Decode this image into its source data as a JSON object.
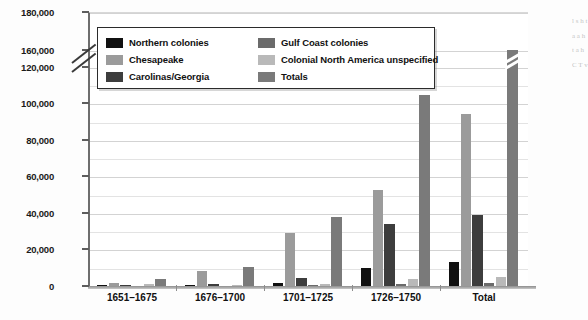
{
  "chart_data": {
    "type": "bar",
    "title": "",
    "xlabel": "",
    "ylabel": "",
    "grid": true,
    "legend_position": "top-left-inside",
    "categories": [
      "1651–1675",
      "1676–1700",
      "1701–1725",
      "1726–1750",
      "Total"
    ],
    "yticks": [
      "0",
      "20,000",
      "40,000",
      "60,000",
      "80,000",
      "100,000",
      "120,000",
      "160,000",
      "180,000"
    ],
    "ytick_values": [
      0,
      20000,
      40000,
      60000,
      80000,
      100000,
      120000,
      160000,
      180000
    ],
    "ylim": [
      0,
      180000
    ],
    "axis_break": {
      "below": 120000,
      "above": 160000,
      "label": "y-axis-break"
    },
    "minor_gridline_step": 10000,
    "series": [
      {
        "name": "Northern colonies",
        "color": "#111111",
        "values": [
          300,
          700,
          1600,
          9800,
          13000
        ]
      },
      {
        "name": "Chesapeake",
        "color": "#9b9b9b",
        "values": [
          1900,
          8000,
          29000,
          52800,
          94000
        ]
      },
      {
        "name": "Carolinas/Georgia",
        "color": "#3d3d3d",
        "values": [
          600,
          1000,
          4200,
          34000,
          39000
        ]
      },
      {
        "name": "Gulf Coast colonies",
        "color": "#6b6b6b",
        "values": [
          0,
          0,
          600,
          1200,
          1900
        ]
      },
      {
        "name": "Colonial North America unspecified",
        "color": "#b9b9b9",
        "values": [
          900,
          600,
          900,
          3800,
          5200
        ]
      },
      {
        "name": "Totals",
        "color": "#7a7a7a",
        "values": [
          3700,
          10300,
          38000,
          104800,
          160000
        ]
      }
    ],
    "notes": {
      "totals_total_bar_break": "Totals bar for Total category is drawn with a break mark near the top of the axis"
    }
  },
  "legend": {
    "items": [
      {
        "label": "Northern colonies",
        "swatch": "#111111"
      },
      {
        "label": "Gulf Coast colonies",
        "swatch": "#6b6b6b"
      },
      {
        "label": "Chesapeake",
        "swatch": "#9b9b9b"
      },
      {
        "label": "Colonial North America unspecified",
        "swatch": "#b9b9b9"
      },
      {
        "label": "Carolinas/Georgia",
        "swatch": "#3d3d3d"
      },
      {
        "label": "Totals",
        "swatch": "#7a7a7a"
      }
    ]
  }
}
